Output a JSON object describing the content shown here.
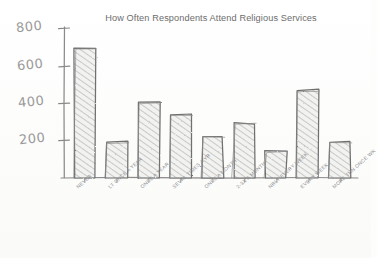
{
  "chart_data": {
    "type": "bar",
    "title": "How Often Respondents Attend Religious Services",
    "xlabel": "",
    "ylabel": "",
    "ylim": [
      0,
      850
    ],
    "grid": false,
    "legend": "none",
    "style": "hand-drawn pencil sketch (xkcd style)",
    "ytick_labels": [
      "800",
      "600",
      "400",
      "200"
    ],
    "ytick_values": [
      800,
      600,
      400,
      200
    ],
    "categories": [
      "NEVER",
      "LT ONCE A YEAR",
      "ONCE A YEAR",
      "SEVRL TIMES A YR",
      "ONCE A MONTH",
      "2-3X A MONTH",
      "NRLY EVERY WEEK",
      "EVERY WEEK",
      "MORE THN ONCE WK"
    ],
    "values": [
      700,
      190,
      407,
      340,
      218,
      287,
      137,
      465,
      185
    ],
    "colors": {
      "ink": "#7b7b7b",
      "bar_fill": "#efefef",
      "bar_stroke": "#6f6f6f",
      "hatch": "#a5a5a5",
      "label": "#8d8d8d",
      "title": "#6d6d6d",
      "background": "#fdfdfc"
    }
  }
}
